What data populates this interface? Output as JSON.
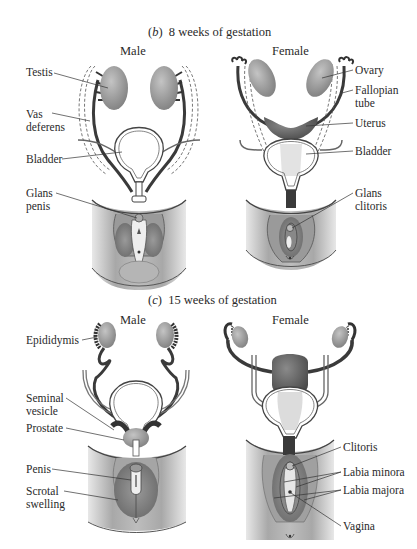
{
  "panel_b": {
    "letter": "b",
    "title": "8 weeks of gestation",
    "male": {
      "heading": "Male",
      "labels": [
        "Testis",
        "Vas\ndeferens",
        "Bladder",
        "Glans\npenis"
      ]
    },
    "female": {
      "heading": "Female",
      "labels": [
        "Ovary",
        "Fallopian\ntube",
        "Uterus",
        "Bladder",
        "Glans\nclitoris"
      ]
    }
  },
  "panel_c": {
    "letter": "c",
    "title": "15 weeks of gestation",
    "male": {
      "heading": "Male",
      "labels": [
        "Epididymis",
        "Seminal\nvesicle",
        "Prostate",
        "Penis",
        "Scrotal\nswelling"
      ]
    },
    "female": {
      "heading": "Female",
      "labels": [
        "Clitoris",
        "Labia minora",
        "Labia majora",
        "Vagina"
      ]
    }
  },
  "colors": {
    "organ_fill": "#9a9a9a",
    "dark_duct": "#3a3a3a",
    "skin": "#b8b8b8",
    "line": "#333333"
  }
}
